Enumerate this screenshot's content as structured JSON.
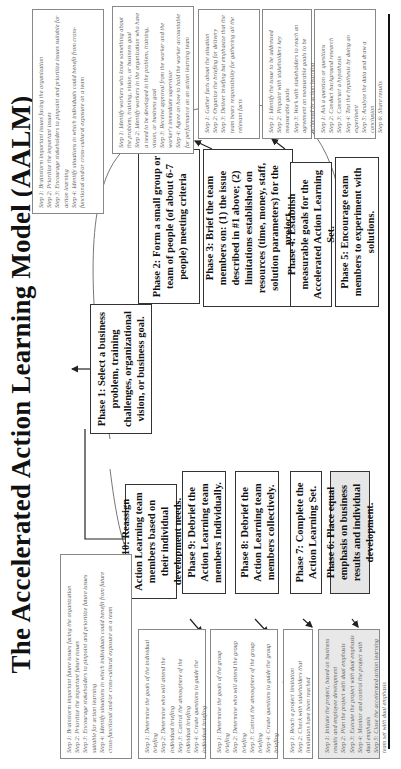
{
  "title": "The Accelerated Action Learning Model (AALM)",
  "phases": [
    {
      "id": 1,
      "label": "Phase 1: Select a business problem, training challenges, organizational vision, or business goal."
    },
    {
      "id": 2,
      "label": "Phase 2: Form a small group or team of people (of about 6-7 people) meeting criteria"
    },
    {
      "id": 3,
      "label": "Phase 3: Brief the team members on: (1) the issue described in #1 above; (2) limitations established on resources (time, money, staff, solution parameters) for the project."
    },
    {
      "id": 4,
      "label": "Phase 4: Establish measurable goals for the Accelerated Action Learning Set."
    },
    {
      "id": 5,
      "label": "Phase 5: Encourage team members to experiment with solutions."
    },
    {
      "id": 6,
      "label": "Phase 6: Place equal emphasis on business results and individual development."
    },
    {
      "id": 7,
      "label": "Phase 7: Complete the Action Learning Set."
    },
    {
      "id": 8,
      "label": "Phase 8: Debrief the Action Learning team members collectively."
    },
    {
      "id": 9,
      "label": "Phase 9: Debrief the Action Learning team members Individually."
    },
    {
      "id": 10,
      "label": "Phase 10: Reassign Action Learning team members based on their individual development needs."
    }
  ],
  "step_boxes": {
    "p1": [
      "Step 1: Brainstorm important issues facing the organization",
      "Step 2: Prioritize the important issues",
      "Step 3: Encourage stakeholders to pinpoint and prioritize issues suitable for action learning",
      "Step 4: Identify situations in which individuals could benefit from cross-functional and/or cross-cultural exposure on a team"
    ],
    "p2": [
      "Step 1: Identify workers who know something about the problem, training, vision, or business goal",
      "Step 2: Identify workers in the organization who have a need to be developed in the problem, training, vision, or business goal",
      "Step 3: Receive approval from the worker and the worker's immediate supervisor",
      "Step 4: Agree on how to hold the worker accountable for performance on an action learning team"
    ],
    "p3": [
      "Step 1: Gather facts about the situation",
      "Step 2: Organize the briefing for delivery",
      "Step 3: Deliver briefing but emphasize that the team bears responsibility for gathering all the relevant facts"
    ],
    "p4": [
      "Step 1: Identify the issue to be addressed",
      "Step 2: Pinpoint with stakeholders key measurable goals",
      "Step 3: Work with stakeholders to reach an agreement on measurable goals to be achieved by action learning"
    ],
    "p5": [
      "Step 1: Ask a question or questions",
      "Step 2: Conduct background research",
      "Step 3: Construct a hypothesis",
      "Step 4: Test the hypothesis by doing an experiment",
      "Step 5: Analyze the data and draw a conclusion",
      "Step 6: Share results"
    ],
    "p10": [
      "Step 1: Brainstorm important future issues facing the organization",
      "Step 2: Prioritize the important future issues",
      "Step 3: Encourage stakeholders to pinpoint and prioritize future issues suitable for action learning",
      "Step 4: Identify situations in which individuals could benefit from future cross-functional and/or cross-cultural exposure on a team"
    ],
    "p9": [
      "Step 1: Determine the goals of the individual briefing",
      "Step 2: Determine who will attend the individual briefing",
      "Step 3: Control the atmosphere of the individual briefing",
      "Step 4: Create questions to guide the individual briefing",
      "Step 5: Hold the individual briefing",
      "Step 6: Analyze and make use of the individual briefing results"
    ],
    "p8": [
      "Step 1: Determine the goals of the group briefing",
      "Step 2: Determine who will attend the group briefing",
      "Step 3: Control the atmosphere of the group briefing",
      "Step 4: Create questions to guide the group briefing",
      "Step 5: Hold the group briefing",
      "Step 6: Analyze and make use of the group briefing results"
    ],
    "p7": [
      "Step 1: Reach a project limitation",
      "Step 2: Check with stakeholders that limitations have been reached"
    ],
    "p6": [
      "Step 1: Initiate the project, based on business results and employee development",
      "Step 2: Plan the project with dual emphasis",
      "Step 3: Execute the project with dual emphasis",
      "Step 4: Monitor and control the project with dual emphasis",
      "Step 5: Close the accelerated action learning team set with dual emphasis"
    ]
  }
}
